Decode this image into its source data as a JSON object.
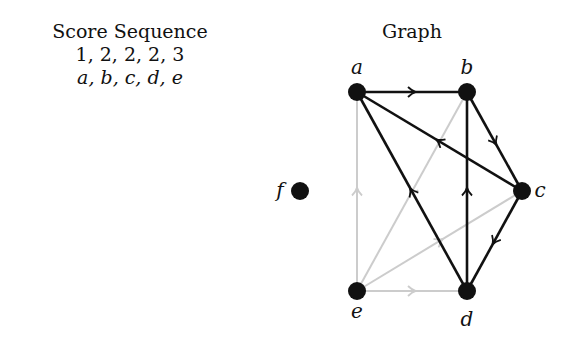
{
  "left_panel": {
    "title": "Score Sequence",
    "scores": "1, 2, 2, 2, 3",
    "vertices": "a, b, c, d, e"
  },
  "graph": {
    "title": "Graph",
    "colors": {
      "main": "#111111",
      "faded": "#cccccc"
    },
    "nodes": [
      {
        "id": "a",
        "x": 357,
        "y": 92,
        "lx": 357,
        "ly": 74
      },
      {
        "id": "b",
        "x": 467,
        "y": 92,
        "lx": 467,
        "ly": 74
      },
      {
        "id": "c",
        "x": 522,
        "y": 191,
        "lx": 540,
        "ly": 197
      },
      {
        "id": "d",
        "x": 467,
        "y": 291,
        "lx": 467,
        "ly": 326
      },
      {
        "id": "e",
        "x": 357,
        "y": 291,
        "lx": 357,
        "ly": 318
      },
      {
        "id": "f",
        "x": 300,
        "y": 191,
        "lx": 280,
        "ly": 197
      }
    ],
    "edges": [
      {
        "from": "a",
        "to": "b",
        "style": "main"
      },
      {
        "from": "b",
        "to": "c",
        "style": "main"
      },
      {
        "from": "c",
        "to": "a",
        "style": "main"
      },
      {
        "from": "d",
        "to": "a",
        "style": "main"
      },
      {
        "from": "d",
        "to": "b",
        "style": "main"
      },
      {
        "from": "c",
        "to": "d",
        "style": "main"
      },
      {
        "from": "e",
        "to": "a",
        "style": "faded"
      },
      {
        "from": "b",
        "to": "e",
        "style": "faded"
      },
      {
        "from": "e",
        "to": "c",
        "style": "faded"
      },
      {
        "from": "e",
        "to": "d",
        "style": "faded"
      }
    ]
  }
}
